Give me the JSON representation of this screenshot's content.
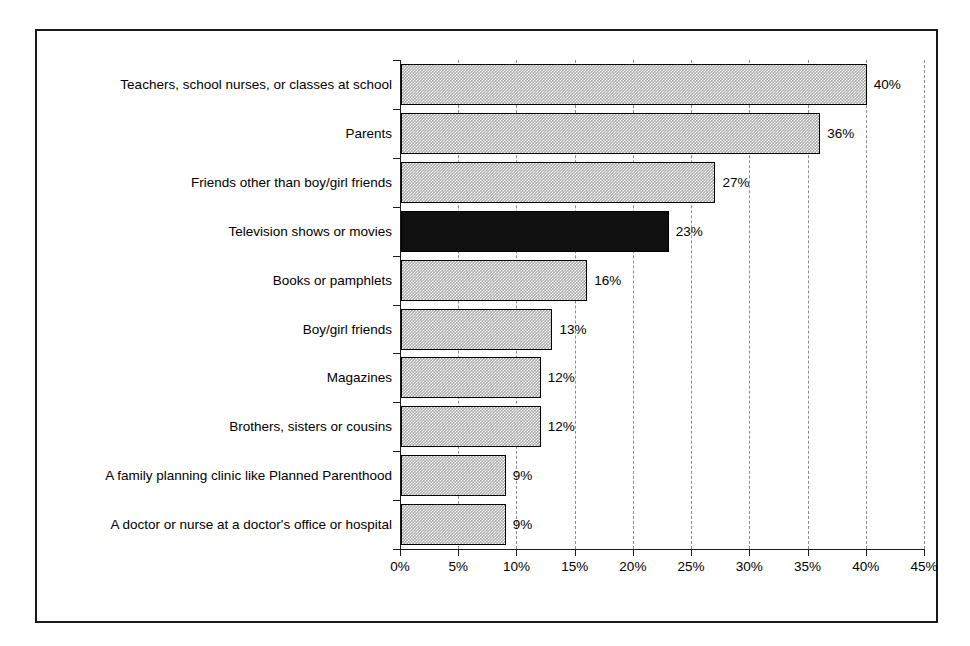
{
  "chart_data": {
    "type": "bar",
    "orientation": "horizontal",
    "title": "",
    "subtitle": "",
    "xlabel": "",
    "ylabel": "",
    "xlim": [
      0,
      45
    ],
    "xtick_step": 5,
    "xtick_labels": [
      "0%",
      "5%",
      "10%",
      "15%",
      "20%",
      "25%",
      "30%",
      "35%",
      "40%",
      "45%"
    ],
    "xtick_values": [
      0,
      5,
      10,
      15,
      20,
      25,
      30,
      35,
      40,
      45
    ],
    "grid": "vertical-dashed",
    "legend": "none",
    "value_suffix": "%",
    "categories": [
      "Teachers, school nurses, or classes at school",
      "Parents",
      "Friends other than boy/girl friends",
      "Television shows or movies",
      "Books or pamphlets",
      "Boy/girl friends",
      "Magazines",
      "Brothers, sisters or cousins",
      "A family planning clinic like Planned Parenthood",
      "A doctor or nurse at a doctor's office or hospital"
    ],
    "values": [
      40,
      36,
      27,
      23,
      16,
      13,
      12,
      12,
      9,
      9
    ],
    "value_labels": [
      "40%",
      "36%",
      "27%",
      "23%",
      "16%",
      "13%",
      "12%",
      "12%",
      "9%",
      "9%"
    ],
    "highlighted_category": "Television shows or movies",
    "colors": {
      "bar_fill": "#a9a9a9",
      "bar_border": "#000000",
      "highlight_fill": "#101010",
      "gridline": "#8e8e8e",
      "axis": "#1a1a1a",
      "text": "#000000",
      "background": "#ffffff"
    }
  }
}
